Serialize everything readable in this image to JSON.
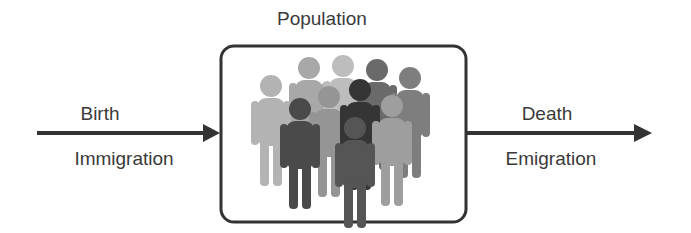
{
  "diagram": {
    "title": "Population",
    "inflow": {
      "top_label": "Birth",
      "bottom_label": "Immigration"
    },
    "outflow": {
      "top_label": "Death",
      "bottom_label": "Emigration"
    },
    "box_icon": "people-crowd-icon",
    "colors": {
      "stroke": "#333333",
      "background": "#ffffff"
    }
  }
}
